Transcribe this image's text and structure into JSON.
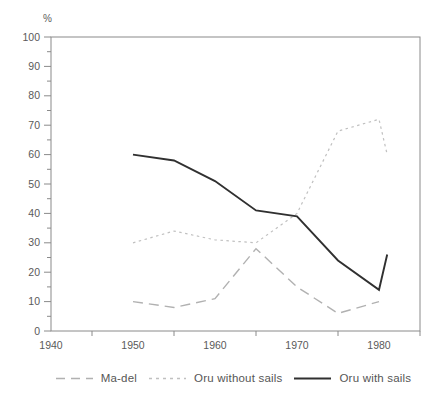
{
  "chart_data": {
    "type": "line",
    "title": "",
    "xlabel": "",
    "ylabel": "%",
    "xlim": [
      1940,
      1985
    ],
    "ylim": [
      0,
      100
    ],
    "x_tick_labels": [
      1940,
      1950,
      1960,
      1970,
      1980
    ],
    "x_minor_ticks": [
      1945,
      1955,
      1965,
      1975,
      1985
    ],
    "y_tick_labels": [
      0,
      10,
      20,
      30,
      40,
      50,
      60,
      70,
      80,
      90,
      100
    ],
    "y_minor_ticks": [
      5,
      15,
      25,
      35,
      45,
      55,
      65,
      75,
      85,
      95
    ],
    "grid": false,
    "legend_position": "bottom",
    "axis_color": "#8a8a8a",
    "tick_text_color": "#5a5a5a",
    "series": [
      {
        "name": "Ma-del",
        "style": "long-dash",
        "color": "#b1b1b1",
        "x": [
          1950,
          1955,
          1960,
          1965,
          1970,
          1975,
          1980
        ],
        "values": [
          10,
          8,
          11,
          28,
          15,
          6,
          10
        ]
      },
      {
        "name": "Oru without sails",
        "style": "short-dash",
        "color": "#c0c0c0",
        "x": [
          1950,
          1955,
          1960,
          1965,
          1970,
          1975,
          1980,
          1981
        ],
        "values": [
          30,
          34,
          31,
          30,
          40,
          68,
          72,
          60
        ]
      },
      {
        "name": "Oru with sails",
        "style": "solid",
        "color": "#303030",
        "x": [
          1950,
          1955,
          1960,
          1965,
          1970,
          1975,
          1980,
          1981
        ],
        "values": [
          60,
          58,
          51,
          41,
          39,
          24,
          14,
          26
        ]
      }
    ]
  },
  "legend": {
    "items": [
      {
        "label": "Ma-del"
      },
      {
        "label": "Oru without sails"
      },
      {
        "label": "Oru with sails"
      }
    ]
  }
}
